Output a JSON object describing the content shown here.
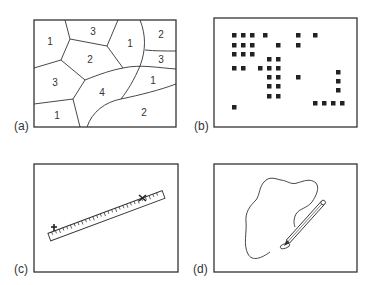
{
  "figure": {
    "panels": [
      {
        "id": "a",
        "label": "(a)",
        "description": "Map of irregular polygons, each labeled with a class number",
        "region_labels": [
          "1",
          "3",
          "1",
          "2",
          "2",
          "3",
          "3",
          "1",
          "4",
          "1",
          "2"
        ]
      },
      {
        "id": "b",
        "label": "(b)",
        "description": "Grid of black squares (raster cells) scattered in a frame",
        "square_count": 39
      },
      {
        "id": "c",
        "label": "(c)",
        "description": "Ruler measuring the distance between two cross marks"
      },
      {
        "id": "d",
        "label": "(d)",
        "description": "Pen tracing an irregular closed outline"
      }
    ]
  }
}
